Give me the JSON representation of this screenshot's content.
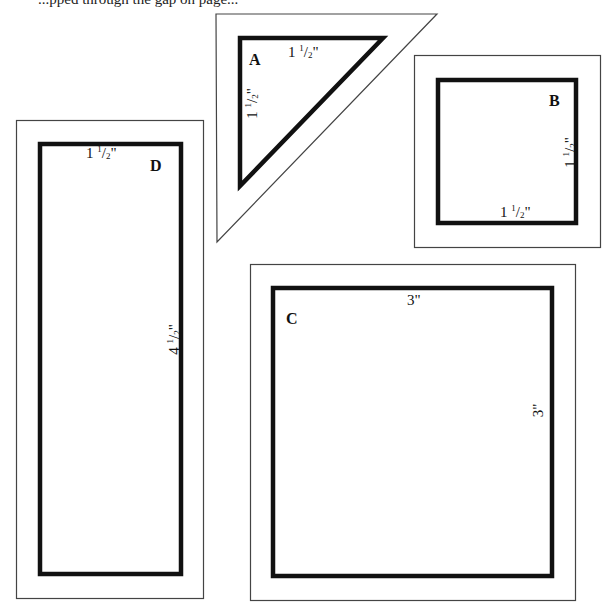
{
  "page": {
    "header_text": "...pped through the gap on page..."
  },
  "colors": {
    "outline_thin": "#444444",
    "outline_thick": "#111111",
    "background": "#ffffff"
  },
  "templates": {
    "A": {
      "letter": "A",
      "shape": "triangle",
      "top_label": {
        "whole": "1",
        "num": "1",
        "den": "2",
        "unit": "\""
      },
      "side_label": {
        "whole": "1",
        "num": "1",
        "den": "2",
        "unit": "\""
      }
    },
    "B": {
      "letter": "B",
      "shape": "square",
      "side_label": {
        "whole": "1",
        "num": "1",
        "den": "2",
        "unit": "\""
      },
      "bottom_label": {
        "whole": "1",
        "num": "1",
        "den": "2",
        "unit": "\""
      }
    },
    "C": {
      "letter": "C",
      "shape": "square",
      "top_label": "3\"",
      "side_label": "3\""
    },
    "D": {
      "letter": "D",
      "shape": "rectangle",
      "top_label": {
        "whole": "1",
        "num": "1",
        "den": "2",
        "unit": "\""
      },
      "side_label": {
        "whole": "4",
        "num": "1",
        "den": "2",
        "unit": "\""
      }
    }
  }
}
